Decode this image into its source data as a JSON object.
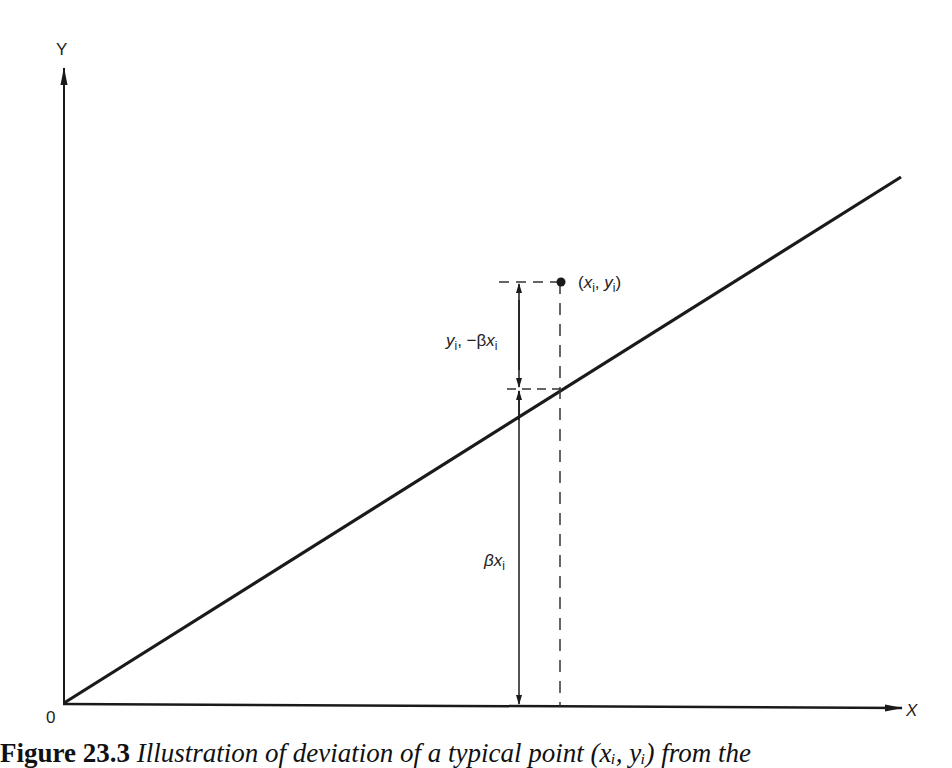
{
  "diagram": {
    "axes": {
      "y_label": "Y",
      "x_label": "X",
      "origin_label": "0"
    },
    "point_label": {
      "open": "(",
      "x": "x",
      "x_sub": "i",
      "sep": ", ",
      "y": "y",
      "y_sub": "i",
      "close": ")"
    },
    "deviation_label": {
      "y": "y",
      "y_sub": "i",
      "mid": ", −β",
      "x": "x",
      "x_sub": "i"
    },
    "fitted_label": {
      "beta": "β",
      "x": "x",
      "x_sub": "i"
    },
    "line_color": "#1a1a1a"
  },
  "caption": {
    "number": "Figure 23.3",
    "text": " Illustration of deviation of a typical point (xᵢ, yᵢ) from the"
  }
}
